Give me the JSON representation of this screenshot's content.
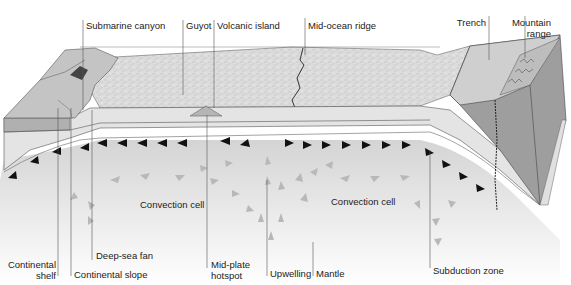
{
  "diagram": {
    "colors": {
      "ocean_floor": "#d9d9d9",
      "crust_band": "#bdbdbd",
      "lithosphere": "#e6e6e6",
      "mantle_gradient_top": "#d6d6d6",
      "mantle_gradient_bottom": "#ffffff",
      "continent_block": "#a9a9a9",
      "arrow_dark": "#111111",
      "arrow_light": "#b5b5b5",
      "leader_line": "#555555"
    },
    "labels_top": [
      {
        "id": "submarine-canyon",
        "text": "Submarine canyon"
      },
      {
        "id": "guyot",
        "text": "Guyot"
      },
      {
        "id": "volcanic-island",
        "text": "Volcanic island"
      },
      {
        "id": "mid-ocean-ridge",
        "text": "Mid-ocean ridge"
      },
      {
        "id": "trench",
        "text": "Trench"
      },
      {
        "id": "mountain-range-1",
        "text": "Mountain"
      },
      {
        "id": "mountain-range-2",
        "text": "range"
      }
    ],
    "labels_middle": [
      {
        "id": "convection-cell-left",
        "text": "Convection cell"
      },
      {
        "id": "convection-cell-right",
        "text": "Convection cell"
      }
    ],
    "labels_bottom": [
      {
        "id": "continental-shelf-1",
        "text": "Continental"
      },
      {
        "id": "continental-shelf-2",
        "text": "shelf"
      },
      {
        "id": "continental-slope",
        "text": "Continental slope"
      },
      {
        "id": "deep-sea-fan",
        "text": "Deep-sea fan"
      },
      {
        "id": "mid-plate-hotspot-1",
        "text": "Mid-plate"
      },
      {
        "id": "mid-plate-hotspot-2",
        "text": "hotspot"
      },
      {
        "id": "upwelling",
        "text": "Upwelling"
      },
      {
        "id": "mantle",
        "text": "Mantle"
      },
      {
        "id": "subduction-zone",
        "text": "Subduction zone"
      }
    ]
  }
}
